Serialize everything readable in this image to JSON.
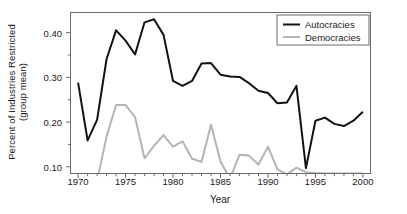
{
  "chart_data": {
    "type": "line",
    "title": "",
    "xlabel": "Year",
    "ylabel": "Percent of Industries Restricted (group mean)",
    "ylabel_line1": "Percent of Industries Restricted",
    "ylabel_line2": "(group mean)",
    "xlim": [
      1969.2,
      2000.8
    ],
    "ylim": [
      0.085,
      0.445
    ],
    "grid": false,
    "legend_position": "top-right",
    "xticks": [
      1970,
      1975,
      1980,
      1985,
      1990,
      1995,
      2000
    ],
    "xtick_labels": [
      "1970",
      "1975",
      "1980",
      "1985",
      "1990",
      "1995",
      "2000"
    ],
    "xticks_minor": [
      1971,
      1972,
      1973,
      1974,
      1976,
      1977,
      1978,
      1979,
      1981,
      1982,
      1983,
      1984,
      1986,
      1987,
      1988,
      1989,
      1991,
      1992,
      1993,
      1994,
      1996,
      1997,
      1998,
      1999
    ],
    "yticks": [
      0.1,
      0.2,
      0.3,
      0.4
    ],
    "ytick_labels": [
      "0.10",
      "0.20",
      "0.30",
      "0.40"
    ],
    "yticks_minor": [
      0.15,
      0.25,
      0.35
    ],
    "x": [
      1970,
      1971,
      1972,
      1973,
      1974,
      1975,
      1976,
      1977,
      1978,
      1979,
      1980,
      1981,
      1982,
      1983,
      1984,
      1985,
      1986,
      1987,
      1988,
      1989,
      1990,
      1991,
      1992,
      1993,
      1994,
      1995,
      1996,
      1997,
      1998,
      1999,
      2000
    ],
    "series": [
      {
        "name": "Autocracies",
        "color": "#121212",
        "width": 2.0,
        "values": [
          0.288,
          0.159,
          0.205,
          0.341,
          0.405,
          0.382,
          0.351,
          0.423,
          0.43,
          0.395,
          0.292,
          0.281,
          0.292,
          0.331,
          0.332,
          0.306,
          0.302,
          0.301,
          0.287,
          0.27,
          0.265,
          0.242,
          0.244,
          0.281,
          0.097,
          0.203,
          0.21,
          0.196,
          0.191,
          0.203,
          0.223
        ]
      },
      {
        "name": "Democracies",
        "color": "#b4b4b4",
        "width": 2.0,
        "values": [
          null,
          null,
          0.068,
          0.168,
          0.238,
          0.238,
          0.211,
          0.119,
          0.147,
          0.171,
          0.145,
          0.157,
          0.118,
          0.111,
          0.194,
          0.112,
          0.073,
          0.127,
          0.125,
          0.105,
          0.145,
          0.094,
          0.083,
          0.098,
          0.088,
          0.086,
          0.085,
          0.085,
          0.085,
          0.085,
          0.085
        ]
      }
    ],
    "legend": [
      {
        "label": "Autocracies",
        "color": "#121212"
      },
      {
        "label": "Democracies",
        "color": "#b4b4b4"
      }
    ]
  },
  "axes": {
    "frame_color": "#6b6b6b"
  }
}
